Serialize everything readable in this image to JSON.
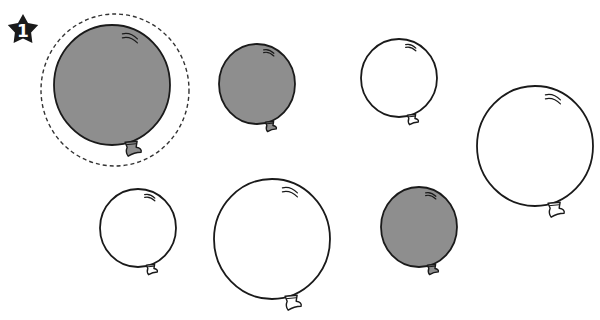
{
  "badge": {
    "number": "1",
    "shape": "star",
    "fill": "#1a1a1a",
    "text_color": "#ffffff"
  },
  "colors": {
    "grey": "#8e8e8e",
    "white": "#ffffff",
    "stroke": "#1a1a1a",
    "dash": "#333333"
  },
  "highlight": {
    "cx": 115,
    "cy": 90,
    "rx": 74,
    "ry": 76,
    "style": "dashed"
  },
  "balloons": [
    {
      "id": 1,
      "size": "large",
      "color": "grey",
      "cx": 112,
      "cy": 85,
      "rx": 58,
      "ry": 60,
      "circled": true
    },
    {
      "id": 2,
      "size": "small",
      "color": "grey",
      "cx": 257,
      "cy": 84,
      "rx": 38,
      "ry": 40,
      "circled": false
    },
    {
      "id": 3,
      "size": "small",
      "color": "white",
      "cx": 399,
      "cy": 78,
      "rx": 38,
      "ry": 39,
      "circled": false
    },
    {
      "id": 4,
      "size": "large",
      "color": "white",
      "cx": 535,
      "cy": 146,
      "rx": 58,
      "ry": 60,
      "circled": false
    },
    {
      "id": 5,
      "size": "small",
      "color": "white",
      "cx": 138,
      "cy": 228,
      "rx": 38,
      "ry": 39,
      "circled": false
    },
    {
      "id": 6,
      "size": "large",
      "color": "white",
      "cx": 272,
      "cy": 239,
      "rx": 58,
      "ry": 60,
      "circled": false
    },
    {
      "id": 7,
      "size": "small",
      "color": "grey",
      "cx": 419,
      "cy": 227,
      "rx": 38,
      "ry": 40,
      "circled": false
    }
  ]
}
